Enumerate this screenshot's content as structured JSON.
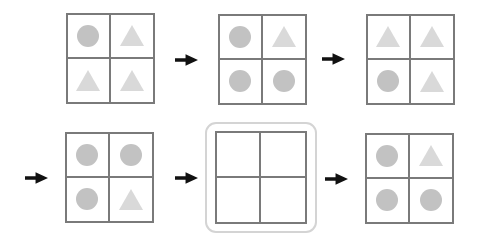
{
  "diagram": {
    "colors": {
      "background": "#ffffff",
      "circle_fill": "#c2c2c2",
      "triangle_fill": "#d9d9d9",
      "grid_line": "#7a7a7a",
      "arrow": "#111111",
      "highlight_border": "#d4d4d4"
    },
    "cell_order": [
      "top-left",
      "top-right",
      "bottom-left",
      "bottom-right"
    ],
    "grids": [
      {
        "position": "row1-grid1",
        "cells": [
          "circle",
          "triangle",
          "triangle",
          "triangle"
        ],
        "highlighted": false
      },
      {
        "position": "row1-grid2",
        "cells": [
          "circle",
          "triangle",
          "circle",
          "circle"
        ],
        "highlighted": false
      },
      {
        "position": "row1-grid3",
        "cells": [
          "triangle",
          "triangle",
          "circle",
          "triangle"
        ],
        "highlighted": false
      },
      {
        "position": "row2-grid1",
        "cells": [
          "circle",
          "circle",
          "circle",
          "triangle"
        ],
        "highlighted": false
      },
      {
        "position": "row2-grid2",
        "cells": [
          "empty",
          "empty",
          "empty",
          "empty"
        ],
        "highlighted": true
      },
      {
        "position": "row2-grid3",
        "cells": [
          "circle",
          "triangle",
          "circle",
          "circle"
        ],
        "highlighted": false
      }
    ],
    "arrows": [
      {
        "direction": "right"
      },
      {
        "direction": "right"
      },
      {
        "direction": "right"
      },
      {
        "direction": "right"
      },
      {
        "direction": "right"
      }
    ]
  }
}
